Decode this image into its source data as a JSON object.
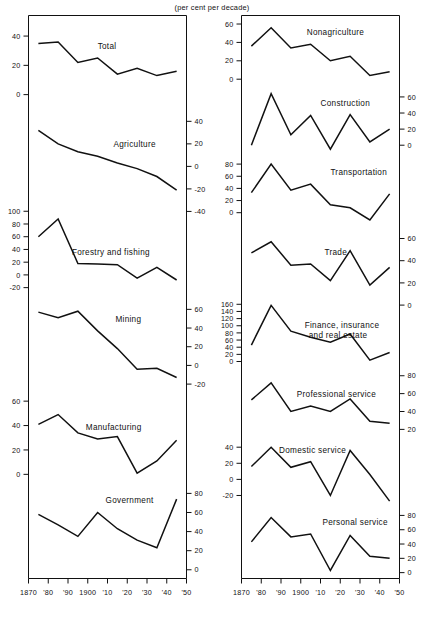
{
  "figure": {
    "header_note": "(per cent per decade)",
    "x_tick_labels": [
      "1870",
      "'80",
      "'90",
      "1900",
      "'10",
      "'20",
      "'30",
      "'40",
      "'50"
    ],
    "x_tick_years": [
      1870,
      1880,
      1890,
      1900,
      1910,
      1920,
      1930,
      1940,
      1950
    ],
    "line_color": "#111111",
    "background_color": "#ffffff"
  },
  "chart_data": {
    "type": "line",
    "title": "",
    "subtitle": "",
    "xlabel": "",
    "ylabel": "(per cent per decade)",
    "grid": false,
    "legend": "none",
    "axis_note": "Each sub-panel has its own vertical scale in per cent per decade; decade midpoints 1875-1945.",
    "x": [
      1875,
      1885,
      1895,
      1905,
      1915,
      1925,
      1935,
      1945
    ],
    "panels": [
      {
        "column": "left",
        "name": "Total",
        "label": "Total",
        "label_x": 1905,
        "axis_side": "left",
        "ticks": [
          0,
          20,
          40
        ],
        "tick_labels": [
          "0",
          "20",
          "40"
        ],
        "ylim": [
          -8,
          52
        ],
        "values": [
          35,
          36,
          22,
          25,
          14,
          18,
          13,
          16
        ]
      },
      {
        "column": "left",
        "name": "Agriculture",
        "label": "Agriculture",
        "label_x": 1913,
        "axis_side": "right",
        "ticks": [
          -40,
          -20,
          0,
          20,
          40
        ],
        "tick_labels": [
          "-40",
          "-20",
          "0",
          "20",
          "40"
        ],
        "ylim": [
          -30,
          48
        ],
        "values": [
          32,
          20,
          13,
          9,
          3,
          -2,
          -9,
          -21
        ]
      },
      {
        "column": "left",
        "name": "Forestry and fishing",
        "label": "Forestry and fishing",
        "label_x": 1892,
        "axis_side": "left",
        "ticks": [
          -20,
          0,
          20,
          40,
          60,
          80,
          100
        ],
        "tick_labels": [
          "-20",
          "0",
          "20",
          "40",
          "60",
          "80",
          "100"
        ],
        "ylim": [
          -30,
          108
        ],
        "values": [
          60,
          88,
          18,
          17,
          16,
          -5,
          12,
          -8
        ]
      },
      {
        "column": "left",
        "name": "Mining",
        "label": "Mining",
        "label_x": 1914,
        "axis_side": "right",
        "ticks": [
          -20,
          0,
          20,
          40,
          60
        ],
        "tick_labels": [
          "-20",
          "0",
          "20",
          "40",
          "60"
        ],
        "ylim": [
          -24,
          70
        ],
        "values": [
          57,
          51,
          58,
          37,
          18,
          -4,
          -3,
          -13
        ]
      },
      {
        "column": "left",
        "name": "Manufacturing",
        "label": "Manufacturing",
        "label_x": 1899,
        "axis_side": "left",
        "ticks": [
          0,
          20,
          40,
          60
        ],
        "tick_labels": [
          "0",
          "20",
          "40",
          "60"
        ],
        "ylim": [
          -6,
          66
        ],
        "values": [
          41,
          49,
          34,
          29,
          31,
          1,
          11,
          28
        ]
      },
      {
        "column": "left",
        "name": "Government",
        "label": "Government",
        "label_x": 1909,
        "axis_side": "right",
        "ticks": [
          0,
          20,
          40,
          60,
          80
        ],
        "tick_labels": [
          "0",
          "20",
          "40",
          "60",
          "80"
        ],
        "ylim": [
          -6,
          86
        ],
        "values": [
          58,
          47,
          35,
          60,
          43,
          31,
          23,
          74
        ]
      },
      {
        "column": "right",
        "name": "Nonagriculture",
        "label": "Nonagriculture",
        "label_x": 1903,
        "axis_side": "left",
        "ticks": [
          0,
          20,
          40,
          60
        ],
        "tick_labels": [
          "0",
          "20",
          "40",
          "60"
        ],
        "ylim": [
          -4,
          66
        ],
        "values": [
          36,
          56,
          34,
          38,
          20,
          25,
          4,
          8
        ]
      },
      {
        "column": "right",
        "name": "Construction",
        "label": "Construction",
        "label_x": 1910,
        "axis_side": "right",
        "ticks": [
          0,
          20,
          40,
          60
        ],
        "tick_labels": [
          "0",
          "20",
          "40",
          "60"
        ],
        "ylim": [
          -10,
          70
        ],
        "values": [
          0,
          64,
          13,
          37,
          -5,
          38,
          4,
          20
        ]
      },
      {
        "column": "right",
        "name": "Transportation",
        "label": "Transportation",
        "label_x": 1915,
        "axis_side": "left",
        "ticks": [
          0,
          20,
          40,
          60,
          80
        ],
        "tick_labels": [
          "0",
          "20",
          "40",
          "60",
          "80"
        ],
        "ylim": [
          -18,
          88
        ],
        "values": [
          33,
          80,
          37,
          47,
          13,
          8,
          -12,
          31
        ]
      },
      {
        "column": "right",
        "name": "Trade",
        "label": "Trade",
        "label_x": 1912,
        "axis_side": "right",
        "ticks": [
          0,
          20,
          40,
          60
        ],
        "tick_labels": [
          "0",
          "20",
          "40",
          "60"
        ],
        "ylim": [
          10,
          68
        ],
        "values": [
          47,
          57,
          36,
          37,
          22,
          49,
          18,
          34
        ]
      },
      {
        "column": "right",
        "name": "Finance, insurance and real estate",
        "label": "Finance, insurance",
        "label2": "and real estate",
        "label_x": 1902,
        "axis_side": "left",
        "ticks": [
          0,
          20,
          40,
          60,
          80,
          100,
          120,
          140,
          160
        ],
        "tick_labels": [
          "0",
          "20",
          "40",
          "60",
          "80",
          "100",
          "120",
          "140",
          "160"
        ],
        "ylim": [
          -8,
          172
        ],
        "values": [
          46,
          157,
          85,
          68,
          54,
          77,
          4,
          25
        ]
      },
      {
        "column": "right",
        "name": "Professional service",
        "label": "Professional service",
        "label_x": 1898,
        "axis_side": "right",
        "ticks": [
          20,
          40,
          60,
          80
        ],
        "tick_labels": [
          "20",
          "40",
          "60",
          "80"
        ],
        "ylim": [
          14,
          86
        ],
        "values": [
          53,
          72,
          40,
          46,
          40,
          54,
          29,
          27
        ]
      },
      {
        "column": "right",
        "name": "Domestic service",
        "label": "Domestic service",
        "label_x": 1889,
        "axis_side": "left",
        "ticks": [
          -20,
          0,
          20,
          40
        ],
        "tick_labels": [
          "-20",
          "0",
          "20",
          "40"
        ],
        "ylim": [
          -32,
          48
        ],
        "values": [
          16,
          40,
          15,
          22,
          -20,
          36,
          6,
          -27
        ]
      },
      {
        "column": "right",
        "name": "Personal service",
        "label": "Personal service",
        "label_x": 1911,
        "axis_side": "right",
        "ticks": [
          0,
          20,
          40,
          60,
          80
        ],
        "tick_labels": [
          "0",
          "20",
          "40",
          "60",
          "80"
        ],
        "ylim": [
          -4,
          86
        ],
        "values": [
          43,
          77,
          50,
          54,
          3,
          52,
          23,
          20
        ]
      }
    ]
  }
}
